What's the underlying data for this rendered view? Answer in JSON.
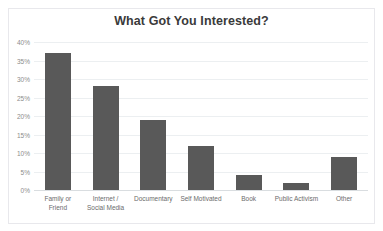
{
  "chart_data": {
    "type": "bar",
    "title": "What Got You Interested?",
    "xlabel": "",
    "ylabel": "",
    "categories": [
      "Family or\nFriend",
      "Internet /\nSocial Media",
      "Documentary",
      "Self Motivated",
      "Book",
      "Public Activism",
      "Other"
    ],
    "values": [
      37,
      28,
      19,
      12,
      4,
      2,
      9
    ],
    "ylim": [
      0,
      40
    ],
    "yticks": [
      0,
      5,
      10,
      15,
      20,
      25,
      30,
      35,
      40
    ],
    "ytick_labels": [
      "0%",
      "5%",
      "10%",
      "15%",
      "20%",
      "25%",
      "30%",
      "35%",
      "40%"
    ],
    "grid": true,
    "legend": false,
    "bar_color": "#595959",
    "gridline_color": "#eceff1",
    "axis_color": "#d9dde0",
    "title_color": "#3a3a3a",
    "tick_color": "#8c8c8c",
    "background": "#ffffff",
    "border_color": "#e8e8ec"
  }
}
